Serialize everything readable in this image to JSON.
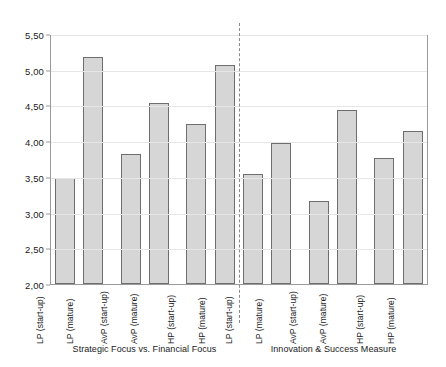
{
  "chart_data": {
    "type": "bar",
    "title": "",
    "subtitle": "",
    "xlabel": "",
    "ylabel": "",
    "ylim": [
      2.0,
      5.5
    ],
    "ytick_labels": [
      "5,50",
      "5,00",
      "4,50",
      "4,00",
      "3,50",
      "3,00",
      "2,50",
      "2,00"
    ],
    "ytick_values": [
      5.5,
      5.0,
      4.5,
      4.0,
      3.5,
      3.0,
      2.5,
      2.0
    ],
    "grid": true,
    "legend": "none",
    "decimal_separator": ",",
    "panels": [
      {
        "caption": "Strategic Focus vs. Financial Focus",
        "categories": [
          "LP (start-up)",
          "LP (mature)",
          "AvP (start-up)",
          "AvP (mature)",
          "HP (start-up)",
          "HP (mature)"
        ],
        "values": [
          3.48,
          5.18,
          3.82,
          4.54,
          4.24,
          5.06
        ]
      },
      {
        "caption": "Innovation & Success Measure",
        "categories": [
          "LP (start-up)",
          "LP (mature)",
          "AvP (start-up)",
          "AvP (mature)",
          "HP (start-up)",
          "HP (mature)"
        ],
        "values": [
          3.54,
          3.97,
          3.16,
          4.43,
          3.77,
          4.14
        ]
      }
    ],
    "colors": {
      "bar_fill": "#d6d6d6",
      "bar_border": "#6e6e6e",
      "gridline": "#e6e6e6",
      "frame": "#9a9a9a",
      "divider": "#8a8a8a",
      "text": "#1a1a1a",
      "background": "#ffffff"
    }
  }
}
